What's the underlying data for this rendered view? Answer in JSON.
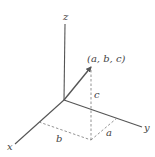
{
  "diagram": {
    "type": "3d-coordinate-axes",
    "axes": {
      "x": {
        "label": "x"
      },
      "y": {
        "label": "y"
      },
      "z": {
        "label": "z"
      }
    },
    "point": {
      "label": "(a, b, c)"
    },
    "components": {
      "a": "a",
      "b": "b",
      "c": "c"
    },
    "colors": {
      "lines": "#555555",
      "dashed": "#777777",
      "text": "#444444",
      "background": "#ffffff"
    }
  }
}
